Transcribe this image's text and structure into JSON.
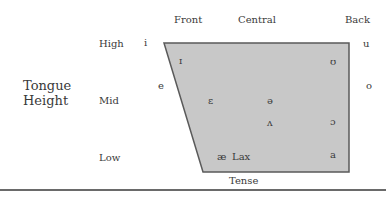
{
  "columns": {
    "front": "Front",
    "central": "Central",
    "back": "Back"
  },
  "rows": {
    "high": "High",
    "mid": "Mid",
    "low": "Low"
  },
  "axis_title": {
    "line1": "Tongue",
    "line2": "Height"
  },
  "outside_vowels": {
    "i": "i",
    "e": "e",
    "u": "u",
    "o": "o"
  },
  "inside_vowels": {
    "ih": "ɪ",
    "uh_round": "ʊ",
    "eh": "ɛ",
    "schwa": "ə",
    "wedge": "ʌ",
    "open_o": "ɔ",
    "ae": "æ",
    "a": "a"
  },
  "region_labels": {
    "lax": "Lax",
    "tense": "Tense"
  },
  "colors": {
    "lax_fill": "#c8c8c8",
    "border": "#5a5a5a",
    "text": "#3a3a3a"
  }
}
